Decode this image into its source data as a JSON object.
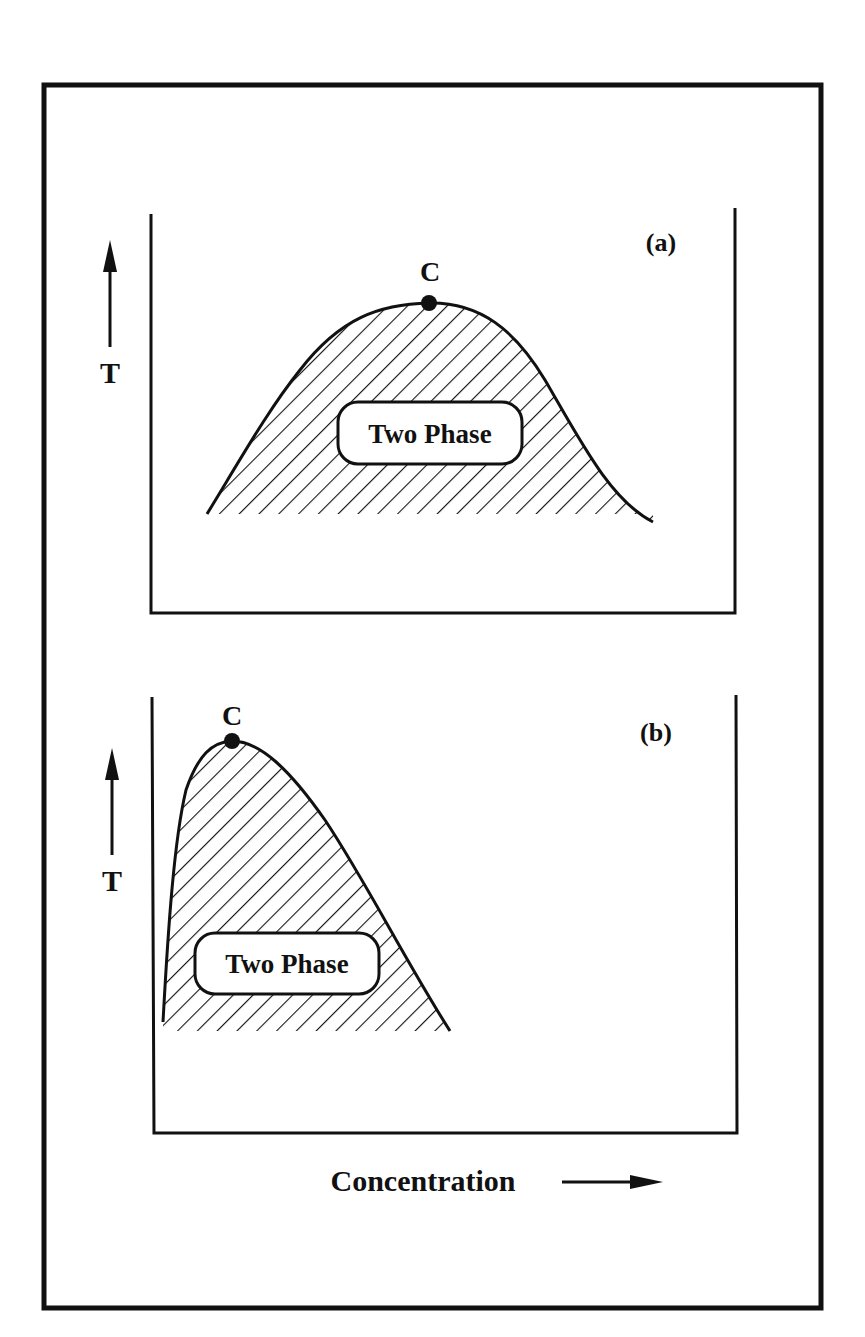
{
  "figure": {
    "x_axis_label": "Concentration",
    "y_axis_label": "T",
    "ink_color": "#111111",
    "background": "#ffffff"
  },
  "panels": [
    {
      "id": "a",
      "tag": "(a)",
      "critical_point_label": "C",
      "region_label": "Two Phase",
      "description": "Symmetric coexistence curve with critical point at the maximum near the middle of the concentration range"
    },
    {
      "id": "b",
      "tag": "(b)",
      "critical_point_label": "C",
      "region_label": "Two Phase",
      "description": "Asymmetric coexistence curve with critical point shifted to low concentration"
    }
  ]
}
